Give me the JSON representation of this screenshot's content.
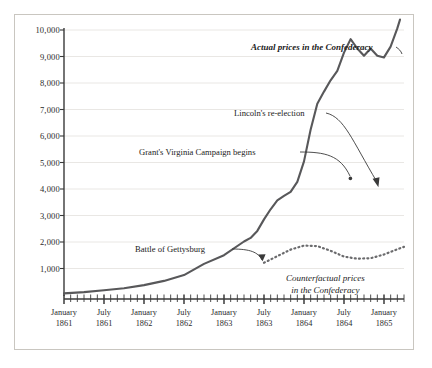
{
  "chart_data": {
    "type": "line",
    "title": "",
    "xlabel": "",
    "ylabel": "",
    "ylim": [
      0,
      10000
    ],
    "ytick_labels": [
      "10,000",
      "9,000",
      "8,000",
      "7,000",
      "6,000",
      "5,000",
      "4,000",
      "3,000",
      "2,000",
      "1,000"
    ],
    "ytick_values": [
      10000,
      9000,
      8000,
      7000,
      6000,
      5000,
      4000,
      3000,
      2000,
      1000
    ],
    "grid": true,
    "legend_position": "inline-annotations",
    "xtick_labels": [
      {
        "month": "January",
        "year": "1861"
      },
      {
        "month": "July",
        "year": "1861"
      },
      {
        "month": "January",
        "year": "1862"
      },
      {
        "month": "July",
        "year": "1862"
      },
      {
        "month": "January",
        "year": "1863"
      },
      {
        "month": "July",
        "year": "1863"
      },
      {
        "month": "January",
        "year": "1864"
      },
      {
        "month": "July",
        "year": "1864"
      },
      {
        "month": "January",
        "year": "1865"
      }
    ],
    "x_axis_start": "January 1861",
    "x_axis_end": "April 1865",
    "x_minor_tick_interval_months": 1,
    "x_major_tick_interval_months": 6,
    "series": [
      {
        "name": "Actual prices in the Confederacy",
        "style": "solid",
        "color": "#58585a",
        "x_months": [
          0,
          3,
          6,
          9,
          12,
          15,
          18,
          21,
          24,
          27,
          28,
          29,
          30,
          31,
          32,
          33,
          34,
          35,
          36,
          37,
          38,
          39,
          40,
          41,
          42,
          43,
          44,
          45,
          46,
          47,
          48,
          49,
          50,
          51
        ],
        "values": [
          100,
          110,
          125,
          140,
          180,
          230,
          300,
          420,
          560,
          700,
          760,
          840,
          980,
          1120,
          1230,
          1280,
          1330,
          1450,
          1700,
          2150,
          2650,
          2950,
          3250,
          3600,
          4200,
          4700,
          4350,
          4150,
          4350,
          4150,
          4100,
          4900,
          6600,
          9200
        ]
      },
      {
        "name": "Counterfactual prices in the Confederacy",
        "style": "dotted",
        "color": "#6b6b6d",
        "x_months": [
          30,
          32,
          34,
          36,
          38,
          40,
          42,
          44,
          46,
          48,
          50,
          51
        ],
        "values": [
          1250,
          1500,
          1750,
          1900,
          1880,
          1700,
          1480,
          1400,
          1420,
          1560,
          1760,
          1850
        ]
      }
    ],
    "annotations": [
      {
        "id": "actual-label",
        "text": "Actual prices in the Confederacy",
        "style": "bold-italic"
      },
      {
        "id": "lincoln",
        "text": "Lincoln's re-election",
        "style": "plain",
        "points_to": "November 1864 trough (~4,100)"
      },
      {
        "id": "grant",
        "text": "Grant's Virginia Campaign begins",
        "style": "plain",
        "points_to": "May 1864 peak (~4,700)"
      },
      {
        "id": "gettysburg",
        "text": "Battle of Gettysburg",
        "style": "plain",
        "points_to": "July 1863 (~1,300)"
      },
      {
        "id": "counterfactual-label",
        "line1": "Counterfactual prices",
        "line2": "in the Confederacy",
        "style": "italic"
      }
    ]
  },
  "colors": {
    "frame_border": "#c9c6c0",
    "grid": "#e3e1dd",
    "axis": "#3a3a3a",
    "actual_line": "#58585a",
    "counterfactual_line": "#6b6b6d",
    "text": "#1b1b1b",
    "background": "#ffffff"
  }
}
